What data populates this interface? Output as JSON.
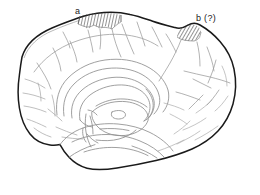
{
  "figure": {
    "background_color": "#ffffff",
    "outline_color": "#1a1a1a",
    "sulci_color": "#8a8a8a",
    "hatch_color": "#3a3a3a",
    "width": 260,
    "height": 195
  },
  "labels": [
    {
      "id": "a",
      "text": "a",
      "x": 75,
      "y": 7,
      "region": "anterior-hatched-cortical-region"
    },
    {
      "id": "b",
      "text": "b (?)",
      "x": 196,
      "y": 14,
      "region": "posterior-hatched-cortical-region"
    }
  ],
  "hatched_regions": [
    {
      "id": "region-a",
      "label": "a",
      "hatch_angle_deg": 78,
      "hatch_spacing_px": 3,
      "bounds": {
        "x": 78,
        "y": 14,
        "width": 44,
        "height": 16
      }
    },
    {
      "id": "region-b",
      "label": "b (?)",
      "hatch_angle_deg": 60,
      "hatch_spacing_px": 3,
      "bounds": {
        "x": 177,
        "y": 24,
        "width": 24,
        "height": 17
      }
    }
  ]
}
